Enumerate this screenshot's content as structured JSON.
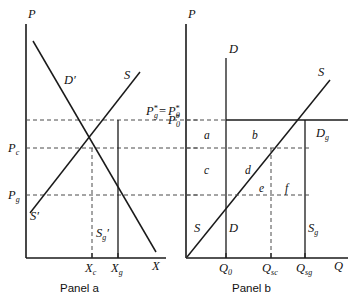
{
  "figure": {
    "type": "economics-supply-demand-diagram",
    "background_color": "#ffffff",
    "line_color": "#1a1a1a",
    "dash_color": "#4a4a4a"
  },
  "panel_a": {
    "caption": "Panel a",
    "axis_y_label": "P",
    "axis_x_label": "X",
    "curves": [
      {
        "name": "demand-curve",
        "label": "D",
        "prime": "′"
      },
      {
        "name": "supply-curve",
        "label": "S",
        "prime": ""
      },
      {
        "name": "supply-prime-curve",
        "label": "S",
        "prime": "′"
      },
      {
        "name": "supply-g-prime-curve",
        "label": "S",
        "prime": "′",
        "sub": "g"
      }
    ],
    "price_ticks": [
      {
        "name": "price-c",
        "base": "P",
        "sub": "c"
      },
      {
        "name": "price-g",
        "base": "P",
        "sub": "g"
      }
    ],
    "quantity_ticks": [
      {
        "name": "quantity-c",
        "base": "X",
        "sub": "c"
      },
      {
        "name": "quantity-g",
        "base": "X",
        "sub": "g"
      }
    ],
    "equilibrium_label": {
      "left_base": "P",
      "left_sub": "g",
      "left_star": "*",
      "equals": "=",
      "right_base": "P",
      "right_sub": "0",
      "right_star": "*"
    }
  },
  "panel_b": {
    "caption": "Panel b",
    "axis_y_label": "P",
    "axis_x_label": "Q",
    "curves": [
      {
        "name": "supply-curve",
        "label": "S"
      },
      {
        "name": "demand-curve",
        "label": "D"
      },
      {
        "name": "demand-top-label",
        "label": "D"
      },
      {
        "name": "supply-top-label",
        "label": "S"
      },
      {
        "name": "demand-g-curve",
        "label": "D",
        "sub": "g"
      },
      {
        "name": "supply-g-curve",
        "label": "S",
        "sub": "g"
      }
    ],
    "price_ticks": [
      {
        "name": "price-star-zero",
        "base": "P",
        "sub": "0",
        "star": "*"
      }
    ],
    "quantity_ticks": [
      {
        "name": "quantity-zero",
        "base": "Q",
        "sub": "0"
      },
      {
        "name": "quantity-sc",
        "base": "Q",
        "sub": "sc"
      },
      {
        "name": "quantity-sg",
        "base": "Q",
        "sub": "sg"
      }
    ],
    "regions": [
      {
        "name": "region-a",
        "label": "a"
      },
      {
        "name": "region-b",
        "label": "b"
      },
      {
        "name": "region-c",
        "label": "c"
      },
      {
        "name": "region-d",
        "label": "d"
      },
      {
        "name": "region-e",
        "label": "e"
      },
      {
        "name": "region-f",
        "label": "f"
      }
    ]
  }
}
